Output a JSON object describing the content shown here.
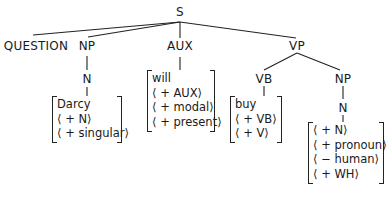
{
  "diagram": {
    "type": "syntax-tree",
    "root": {
      "label": "S",
      "children": [
        {
          "label": "QUESTION"
        },
        {
          "label": "NP",
          "children": [
            {
              "label": "N",
              "features": [
                "Darcy",
                "⟨ + N⟩",
                "⟨ + singular⟩"
              ]
            }
          ]
        },
        {
          "label": "AUX",
          "features": [
            "will",
            "⟨ + AUX⟩",
            "⟨ + modal⟩",
            "⟨ + present⟩"
          ]
        },
        {
          "label": "VP",
          "children": [
            {
              "label": "VB",
              "features": [
                "buy",
                "⟨ + VB⟩",
                "⟨ + V⟩"
              ]
            },
            {
              "label": "NP",
              "children": [
                {
                  "label": "N",
                  "features": [
                    "⟨ + N⟩",
                    "⟨ + pronoun⟩",
                    "⟨ − human⟩",
                    "⟨ + WH⟩"
                  ]
                }
              ]
            }
          ]
        }
      ]
    }
  },
  "nodes": {
    "s": "S",
    "question": "QUESTION",
    "np1": "NP",
    "n1": "N",
    "aux": "AUX",
    "vp": "VP",
    "vb": "VB",
    "np2": "NP",
    "n2": "N"
  },
  "features": {
    "darcy": [
      "Darcy",
      "⟨ + N⟩",
      "⟨ + singular⟩"
    ],
    "will": [
      "will",
      "⟨ + AUX⟩",
      "⟨ + modal⟩",
      "⟨ + present⟩"
    ],
    "buy": [
      "buy",
      "⟨ + VB⟩",
      "⟨ + V⟩"
    ],
    "what": [
      "⟨ + N⟩",
      "⟨ + pronoun⟩",
      "⟨ − human⟩",
      "⟨ + WH⟩"
    ]
  },
  "colors": {
    "ink": "#1a1a1a",
    "background": "#ffffff"
  }
}
